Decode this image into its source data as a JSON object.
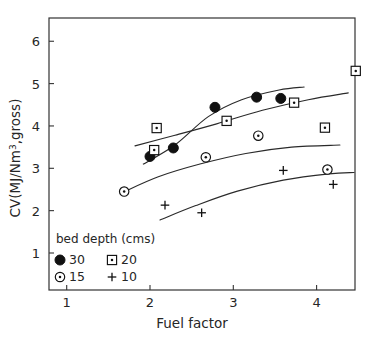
{
  "chart_data": {
    "type": "scatter",
    "title": "",
    "xlabel": "Fuel factor",
    "ylabel": "CV(MJ/Nm3,gross)",
    "ylabel_display": "CV(MJ/Nm",
    "ylabel_superscript": "3",
    "ylabel_tail": ",gross)",
    "xlim": [
      0.6,
      4.67
    ],
    "ylim": [
      0.12,
      6.4
    ],
    "grid": false,
    "xticks": [
      1,
      2,
      3,
      4
    ],
    "yticks": [
      1,
      2,
      3,
      4,
      5,
      6
    ],
    "xtick_labels": [
      "1",
      "2",
      "3",
      "4"
    ],
    "ytick_labels": [
      "1",
      "2",
      "3",
      "4",
      "5",
      "6"
    ],
    "legend_position": "lower-left-inside",
    "legend_title": "bed depth (cms)",
    "series": [
      {
        "name": "30",
        "legend_label": "30",
        "marker": "filled-circle",
        "color": "#111111",
        "points": [
          {
            "x": 2.0,
            "y": 3.28
          },
          {
            "x": 2.28,
            "y": 3.48
          },
          {
            "x": 2.78,
            "y": 4.44
          },
          {
            "x": 3.28,
            "y": 4.68
          },
          {
            "x": 3.57,
            "y": 4.65
          }
        ],
        "trend": [
          {
            "x": 1.92,
            "y": 3.1
          },
          {
            "x": 2.3,
            "y": 3.55
          },
          {
            "x": 2.7,
            "y": 4.22
          },
          {
            "x": 3.1,
            "y": 4.62
          },
          {
            "x": 3.55,
            "y": 4.85
          },
          {
            "x": 3.85,
            "y": 4.92
          }
        ]
      },
      {
        "name": "20",
        "legend_label": "20",
        "marker": "dotted-square",
        "color": "#111111",
        "points": [
          {
            "x": 2.05,
            "y": 3.43
          },
          {
            "x": 2.08,
            "y": 3.95
          },
          {
            "x": 2.92,
            "y": 4.12
          },
          {
            "x": 3.73,
            "y": 4.55
          },
          {
            "x": 4.1,
            "y": 3.96
          },
          {
            "x": 4.47,
            "y": 5.3
          }
        ],
        "trend": [
          {
            "x": 1.82,
            "y": 3.53
          },
          {
            "x": 2.3,
            "y": 3.78
          },
          {
            "x": 2.8,
            "y": 4.05
          },
          {
            "x": 3.35,
            "y": 4.37
          },
          {
            "x": 3.9,
            "y": 4.62
          },
          {
            "x": 4.38,
            "y": 4.78
          }
        ]
      },
      {
        "name": "15",
        "legend_label": "15",
        "marker": "open-circle-dot",
        "color": "#111111",
        "points": [
          {
            "x": 1.69,
            "y": 2.45
          },
          {
            "x": 2.67,
            "y": 3.26
          },
          {
            "x": 3.3,
            "y": 3.77
          },
          {
            "x": 4.13,
            "y": 2.97
          }
        ],
        "trend": [
          {
            "x": 1.66,
            "y": 2.42
          },
          {
            "x": 2.1,
            "y": 2.8
          },
          {
            "x": 2.6,
            "y": 3.1
          },
          {
            "x": 3.15,
            "y": 3.35
          },
          {
            "x": 3.7,
            "y": 3.5
          },
          {
            "x": 4.28,
            "y": 3.55
          }
        ]
      },
      {
        "name": "10",
        "legend_label": "10",
        "marker": "plus",
        "color": "#111111",
        "points": [
          {
            "x": 2.18,
            "y": 2.13
          },
          {
            "x": 2.62,
            "y": 1.95
          },
          {
            "x": 3.6,
            "y": 2.95
          },
          {
            "x": 4.2,
            "y": 2.62
          }
        ],
        "trend": [
          {
            "x": 2.12,
            "y": 1.78
          },
          {
            "x": 2.55,
            "y": 2.12
          },
          {
            "x": 3.05,
            "y": 2.46
          },
          {
            "x": 3.6,
            "y": 2.72
          },
          {
            "x": 4.15,
            "y": 2.87
          },
          {
            "x": 4.45,
            "y": 2.9
          }
        ]
      }
    ]
  }
}
